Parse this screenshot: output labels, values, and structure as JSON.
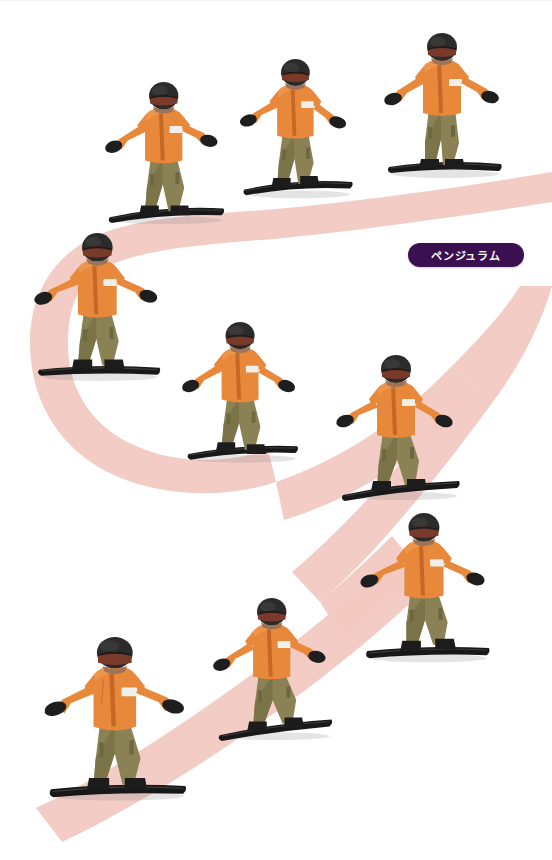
{
  "canvas": {
    "width": 552,
    "height": 860,
    "background": "#ffffff"
  },
  "badge": {
    "label": "ペンジュラム",
    "bg": "#3b1050",
    "fg": "#ffffff",
    "x": 408,
    "y": 243,
    "w": 116,
    "h": 24,
    "font_size": 11
  },
  "trail": {
    "name": "pendulum-path",
    "color": "#f3c9c2",
    "opacity": 0.95,
    "shape": "s-curve",
    "description": "Thick salmon-pink S-shaped band traversing the slope from upper-right, curving left, then back right and down to the lower-left."
  },
  "palette": {
    "jacket": "#e8883a",
    "jacket_shade": "#cf6f28",
    "jacket_light": "#f2a35c",
    "pants": "#8a8255",
    "pants_shade": "#6e6841",
    "helmet": "#2b2b2b",
    "helmet_hi": "#444444",
    "goggles": "#7a3a2a",
    "goggles_rim": "#1c1c1c",
    "gloves": "#1e1e1e",
    "board": "#181818",
    "board_edge": "#3a3a3a",
    "skin": "#9b7358",
    "patch": "#f0efe9",
    "shadow": "rgba(120,120,120,0.22)"
  },
  "riders": [
    {
      "id": "rider-1",
      "label": "snowboarder-top-right",
      "x": 377,
      "y": 33,
      "scale": 1.0
    },
    {
      "id": "rider-2",
      "label": "snowboarder-top-middle",
      "x": 233,
      "y": 59,
      "scale": 0.96
    },
    {
      "id": "rider-3",
      "label": "snowboarder-top-left",
      "x": 100,
      "y": 82,
      "scale": 0.98
    },
    {
      "id": "rider-4",
      "label": "snowboarder-left-apex",
      "x": 31,
      "y": 233,
      "scale": 1.02
    },
    {
      "id": "rider-5",
      "label": "snowboarder-middle-center",
      "x": 177,
      "y": 322,
      "scale": 0.97
    },
    {
      "id": "rider-6",
      "label": "snowboarder-middle-right",
      "x": 331,
      "y": 355,
      "scale": 1.0
    },
    {
      "id": "rider-7",
      "label": "snowboarder-right-apex",
      "x": 357,
      "y": 513,
      "scale": 1.03
    },
    {
      "id": "rider-8",
      "label": "snowboarder-bottom-middle",
      "x": 208,
      "y": 598,
      "scale": 0.98
    },
    {
      "id": "rider-9",
      "label": "snowboarder-bottom-left",
      "x": 42,
      "y": 637,
      "scale": 1.12
    }
  ]
}
